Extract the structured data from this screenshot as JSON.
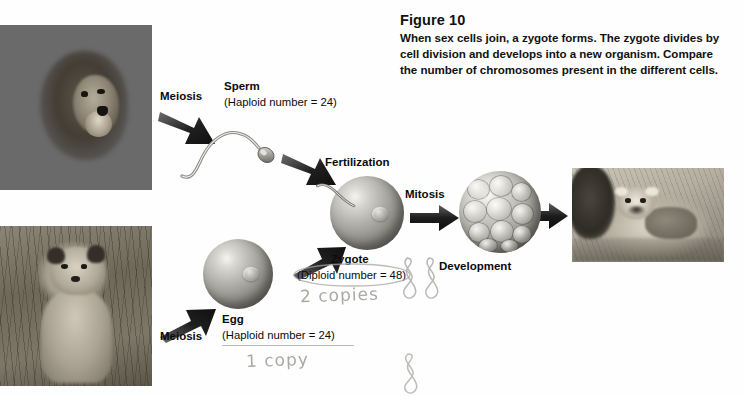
{
  "figure": {
    "title": "Figure 10",
    "caption_line1": "When sex cells join,  a zygote forms.  The zygote divides by",
    "caption_line2": "cell division and develops into a new organism.  Compare",
    "caption_line3": "the number of chromosomes present in the different cells."
  },
  "labels": {
    "meiosis_top": "Meiosis",
    "meiosis_bottom": "Meiosis",
    "sperm": "Sperm",
    "sperm_haploid": "(Haploid number = 24)",
    "egg": "Egg",
    "egg_haploid": "(Haploid number = 24)",
    "fertilization": "Fertilization",
    "zygote": "Zygote",
    "zygote_diploid": "(Diploid number = 48)",
    "mitosis": "Mitosis",
    "development": "Development"
  },
  "photos": {
    "male_lion": "male-lion-photo",
    "lioness": "lioness-photo",
    "cub": "lion-cub-photo"
  },
  "cells": {
    "sperm_cell": "sperm-cell",
    "egg_cell": "egg-cell",
    "zygote_cell": "zygote-cell",
    "morula_cell": "morula-cell"
  },
  "annotations": {
    "two_copies": "2 copies",
    "one_copy": "1 copy",
    "doodle_pair": "chromosome-pair-doodle",
    "doodle_single": "chromosome-single-doodle"
  },
  "colors": {
    "background": "#fefefe",
    "text": "#0b0b0b",
    "arrow": "#1a1a1a",
    "handwriting": "#9e9b96"
  }
}
